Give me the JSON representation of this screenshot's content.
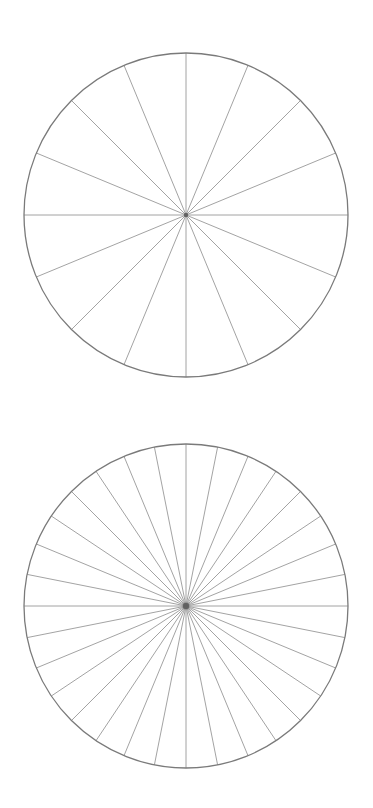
{
  "diagram": {
    "type": "radial-sector-templates",
    "stroke_color": "#8c8c8c",
    "rim_color": "#7a7a7a",
    "hub_color": "#555555",
    "background": "#ffffff",
    "wheels": [
      {
        "id": "top",
        "sectors": 16,
        "degrees_per_sector": 22.5,
        "center": [
          186,
          215
        ],
        "radius": 162
      },
      {
        "id": "bottom",
        "sectors": 32,
        "degrees_per_sector": 11.25,
        "center": [
          186,
          206
        ],
        "radius": 162
      }
    ]
  }
}
